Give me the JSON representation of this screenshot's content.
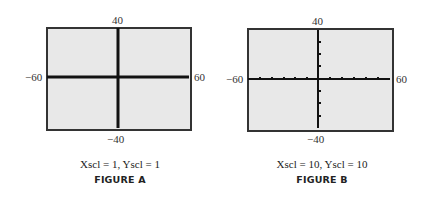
{
  "figures": [
    {
      "id": "A",
      "title": "FIGURE A",
      "caption": "Xscl = 1, Yscl = 1",
      "window": {
        "xmin": "-60",
        "xmax": "60",
        "ymin": "-40",
        "ymax": "40"
      },
      "labels": {
        "xmin": "−60",
        "xmax": "60",
        "ymin": "−40",
        "ymax": "40"
      },
      "axis_style": "thick solid (tick marks so dense they merge)"
    },
    {
      "id": "B",
      "title": "FIGURE B",
      "caption": "Xscl = 10, Yscl = 10",
      "window": {
        "xmin": "-60",
        "xmax": "60",
        "ymin": "-40",
        "ymax": "40"
      },
      "labels": {
        "xmin": "−60",
        "xmax": "60",
        "ymin": "−40",
        "ymax": "40"
      },
      "axis_style": "thin axes with tick marks every 10 units"
    }
  ],
  "colors": {
    "frame_fill": "#e8e8e8",
    "frame_border": "#333333",
    "axis": "#111111"
  }
}
